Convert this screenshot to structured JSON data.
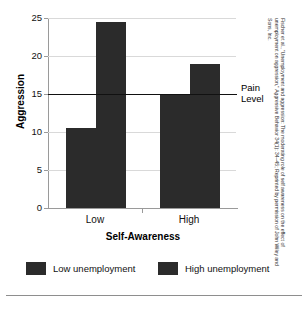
{
  "chart_data": {
    "type": "bar",
    "title": "",
    "xlabel": "Self-Awareness",
    "ylabel": "Aggression",
    "categories": [
      "Low",
      "High"
    ],
    "series": [
      {
        "name": "Low unemployment",
        "values": [
          10.5,
          15.0
        ]
      },
      {
        "name": "High unemployment",
        "values": [
          24.5,
          19.0
        ]
      }
    ],
    "ylim": [
      0,
      25
    ],
    "yticks": [
      0,
      5,
      10,
      15,
      20,
      25
    ],
    "ytick_labels": [
      "0",
      "5",
      "10",
      "15",
      "20",
      "25"
    ],
    "grid": true,
    "legend_position": "bottom",
    "bar_color": "#2b2b2b",
    "annotations": [
      {
        "name": "pain-level",
        "label": "Pain Level",
        "value": 15,
        "type": "horizontal-reference-line"
      }
    ]
  },
  "axes": {
    "y_title": "Aggression",
    "x_title": "Self-Awareness"
  },
  "annotation": {
    "pain_level_line1": "Pain",
    "pain_level_line2": "Level"
  },
  "legend": {
    "items": [
      {
        "label": "Low unemployment",
        "color": "#2b2b2b"
      },
      {
        "label": "High unemployment",
        "color": "#2b2b2b"
      }
    ]
  },
  "credit": {
    "text": "Fischer et al., \"Unemployment and aggression: The moderating role of self awareness on the effect of unemployment on aggression,\" Aggressive Behavior 34(1): 34–45; Reprinted by permission of John Wiley and Sons, Inc."
  }
}
